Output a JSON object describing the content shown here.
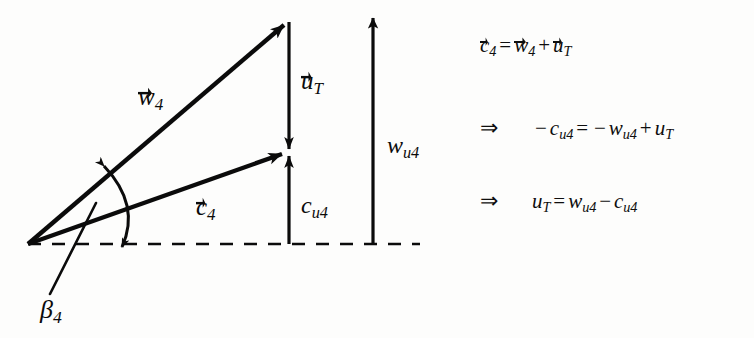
{
  "figure": {
    "type": "velocity-triangle-vector-diagram",
    "background_color": "#fdfdfc",
    "ink_color": "#0b0b0b"
  },
  "diagram": {
    "origin": {
      "x": 28,
      "y": 244
    },
    "baseline": {
      "name": "dashed-horizontal-axis",
      "x_start": 28,
      "x_end": 420,
      "y": 244,
      "style": "dashed"
    },
    "vectors": [
      {
        "id": "w4",
        "label": "w",
        "subscript": "4",
        "has_vector_arrow": true,
        "from": {
          "x": 28,
          "y": 244
        },
        "to": {
          "x": 288,
          "y": 22
        },
        "direction": "up-right"
      },
      {
        "id": "c4",
        "label": "c",
        "subscript": "4",
        "has_vector_arrow": true,
        "from": {
          "x": 28,
          "y": 244
        },
        "to": {
          "x": 287,
          "y": 152
        },
        "direction": "up-right"
      },
      {
        "id": "uT",
        "label": "u",
        "subscript": "T",
        "has_vector_arrow": true,
        "from": {
          "x": 289,
          "y": 22
        },
        "to": {
          "x": 289,
          "y": 152
        },
        "direction": "down"
      },
      {
        "id": "cu4",
        "label": "c",
        "subscript": "u4",
        "has_vector_arrow": false,
        "from": {
          "x": 289,
          "y": 244
        },
        "to": {
          "x": 289,
          "y": 152
        },
        "direction": "up"
      },
      {
        "id": "wu4",
        "label": "w",
        "subscript": "u4",
        "has_vector_arrow": false,
        "from": {
          "x": 373,
          "y": 244
        },
        "to": {
          "x": 373,
          "y": 14
        },
        "direction": "up"
      }
    ],
    "angle": {
      "id": "beta4",
      "symbol": "β",
      "subscript": "4",
      "description": "angle arc between w4 vector and baseline, double headed",
      "leader_line": {
        "from": {
          "x": 96,
          "y": 203
        },
        "to": {
          "x": 50,
          "y": 294
        }
      }
    }
  },
  "equations": [
    {
      "id": "eq-1",
      "implies": "",
      "lhs": {
        "symbol": "c",
        "subscript": "4",
        "vector": true
      },
      "text": "c⃗₄ = w⃗₄ + u⃗_T",
      "parts": {
        "c": "c",
        "c_sub": "4",
        "eq": "=",
        "w": "w",
        "w_sub": "4",
        "plus": "+",
        "u": "u",
        "u_sub": "T"
      }
    },
    {
      "id": "eq-2",
      "implies": "⇒",
      "text": "−c_u4 = −w_u4 + u_T",
      "parts": {
        "minus1": "−",
        "c": "c",
        "c_sub": "u4",
        "eq": "=",
        "minus2": "−",
        "w": "w",
        "w_sub": "u4",
        "plus": "+",
        "u": "u",
        "u_sub": "T"
      }
    },
    {
      "id": "eq-3",
      "implies": "⇒",
      "text": "u_T = w_u4 − c_u4",
      "parts": {
        "u": "u",
        "u_sub": "T",
        "eq": "=",
        "w": "w",
        "w_sub": "u4",
        "minus": "−",
        "c": "c",
        "c_sub": "u4"
      }
    }
  ],
  "labels": {
    "w4": {
      "base": "w",
      "sub": "4",
      "vector": true
    },
    "c4": {
      "base": "c",
      "sub": "4",
      "vector": true
    },
    "uT": {
      "base": "u",
      "sub": "T",
      "vector": true
    },
    "cu4": {
      "base": "c",
      "sub": "u4",
      "vector": false
    },
    "wu4": {
      "base": "w",
      "sub": "u4",
      "vector": false
    },
    "beta4": {
      "base": "β",
      "sub": "4",
      "vector": false
    }
  }
}
